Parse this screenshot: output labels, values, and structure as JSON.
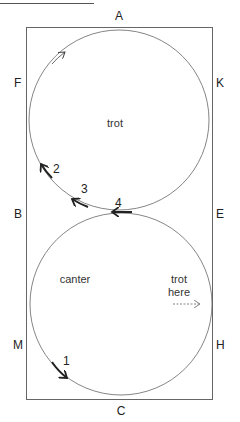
{
  "caption_fragment": "",
  "arena": {
    "markers": {
      "top": "A",
      "bottom": "C",
      "left_top": "F",
      "left_middle": "B",
      "left_bottom": "M",
      "right_top": "K",
      "right_middle": "E",
      "right_bottom": "H"
    }
  },
  "circles": {
    "upper": {
      "label": "trot"
    },
    "lower": {
      "label": "canter",
      "note_line1": "trot",
      "note_line2": "here"
    }
  },
  "steps": [
    "1",
    "2",
    "3",
    "4"
  ],
  "colors": {
    "line": "#555555",
    "arrow": "#222222",
    "text": "#222222"
  }
}
